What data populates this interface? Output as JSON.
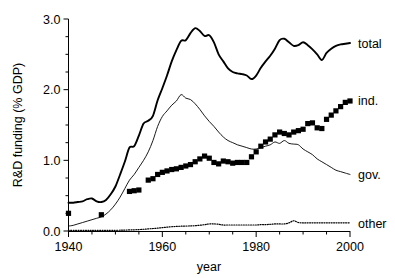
{
  "chart_data": {
    "type": "line",
    "title": "",
    "xlabel": "year",
    "ylabel": "R&D funding (% GDP)",
    "xlim": [
      1940,
      2000
    ],
    "ylim": [
      0.0,
      3.0
    ],
    "x_ticks": [
      1940,
      1960,
      1980,
      2000
    ],
    "x_tick_labels": [
      "1940",
      "1960",
      "1980",
      "2000"
    ],
    "x_minor_step": 5,
    "y_ticks": [
      0.0,
      1.0,
      2.0,
      3.0
    ],
    "y_tick_labels": [
      "0.0",
      "1.0",
      "2.0",
      "3.0"
    ],
    "y_minor_step": 0.25,
    "grid": false,
    "legend_position": "right-inline",
    "series": [
      {
        "name": "total",
        "label": "total",
        "style": "solid-thick",
        "color": "#000000",
        "label_value_x": 2000,
        "label_value_y": 2.66,
        "x": [
          1940,
          1941,
          1942,
          1943,
          1944,
          1945,
          1946,
          1947,
          1948,
          1949,
          1950,
          1951,
          1952,
          1953,
          1954,
          1955,
          1956,
          1957,
          1958,
          1959,
          1960,
          1961,
          1962,
          1963,
          1964,
          1965,
          1966,
          1967,
          1968,
          1969,
          1970,
          1971,
          1972,
          1973,
          1974,
          1975,
          1976,
          1977,
          1978,
          1979,
          1980,
          1981,
          1982,
          1983,
          1984,
          1985,
          1986,
          1987,
          1988,
          1989,
          1990,
          1991,
          1992,
          1993,
          1994,
          1995,
          1996,
          1997,
          1998,
          1999,
          2000
        ],
        "y": [
          0.4,
          0.4,
          0.41,
          0.42,
          0.45,
          0.46,
          0.42,
          0.41,
          0.44,
          0.52,
          0.63,
          0.8,
          0.98,
          1.18,
          1.2,
          1.35,
          1.52,
          1.56,
          1.63,
          1.85,
          2.02,
          2.2,
          2.4,
          2.56,
          2.69,
          2.7,
          2.8,
          2.87,
          2.83,
          2.76,
          2.77,
          2.67,
          2.5,
          2.4,
          2.3,
          2.25,
          2.23,
          2.22,
          2.2,
          2.15,
          2.2,
          2.31,
          2.4,
          2.48,
          2.58,
          2.7,
          2.72,
          2.67,
          2.62,
          2.63,
          2.67,
          2.63,
          2.57,
          2.5,
          2.42,
          2.52,
          2.58,
          2.62,
          2.64,
          2.65,
          2.66
        ]
      },
      {
        "name": "gov",
        "label": "gov.",
        "style": "solid-thin",
        "color": "#000000",
        "label_value_x": 2000,
        "label_value_y": 0.8,
        "x": [
          1940,
          1941,
          1942,
          1943,
          1944,
          1945,
          1946,
          1947,
          1948,
          1949,
          1950,
          1951,
          1952,
          1953,
          1954,
          1955,
          1956,
          1957,
          1958,
          1959,
          1960,
          1961,
          1962,
          1963,
          1964,
          1965,
          1966,
          1967,
          1968,
          1969,
          1970,
          1971,
          1972,
          1973,
          1974,
          1975,
          1976,
          1977,
          1978,
          1979,
          1980,
          1981,
          1982,
          1983,
          1984,
          1985,
          1986,
          1987,
          1988,
          1989,
          1990,
          1991,
          1992,
          1993,
          1994,
          1995,
          1996,
          1997,
          1998,
          1999,
          2000
        ],
        "y": [
          0.07,
          0.08,
          0.1,
          0.12,
          0.14,
          0.16,
          0.18,
          0.2,
          0.24,
          0.3,
          0.38,
          0.48,
          0.6,
          0.72,
          0.8,
          0.9,
          1.0,
          1.12,
          1.28,
          1.48,
          1.62,
          1.7,
          1.78,
          1.84,
          1.93,
          1.88,
          1.86,
          1.8,
          1.72,
          1.63,
          1.55,
          1.48,
          1.4,
          1.33,
          1.28,
          1.25,
          1.22,
          1.2,
          1.18,
          1.16,
          1.16,
          1.18,
          1.2,
          1.22,
          1.26,
          1.24,
          1.28,
          1.24,
          1.23,
          1.22,
          1.16,
          1.12,
          1.08,
          1.02,
          0.98,
          0.94,
          0.9,
          0.86,
          0.84,
          0.82,
          0.8
        ]
      },
      {
        "name": "ind",
        "label": "ind.",
        "style": "square-markers",
        "color": "#000000",
        "label_value_x": 2000,
        "label_value_y": 1.84,
        "x": [
          1940,
          1947,
          1953,
          1954,
          1955,
          1957,
          1958,
          1959,
          1960,
          1961,
          1962,
          1963,
          1964,
          1965,
          1966,
          1967,
          1968,
          1969,
          1970,
          1971,
          1972,
          1973,
          1974,
          1975,
          1976,
          1977,
          1978,
          1979,
          1980,
          1981,
          1982,
          1983,
          1984,
          1985,
          1986,
          1987,
          1988,
          1989,
          1990,
          1991,
          1992,
          1993,
          1994,
          1995,
          1996,
          1997,
          1998,
          1999,
          2000
        ],
        "y": [
          0.25,
          0.23,
          0.56,
          0.57,
          0.58,
          0.72,
          0.74,
          0.8,
          0.83,
          0.85,
          0.87,
          0.88,
          0.9,
          0.92,
          0.94,
          0.98,
          1.02,
          1.06,
          1.03,
          0.97,
          0.95,
          0.99,
          0.98,
          0.96,
          0.97,
          0.97,
          0.97,
          1.05,
          1.12,
          1.2,
          1.26,
          1.3,
          1.36,
          1.4,
          1.38,
          1.36,
          1.4,
          1.42,
          1.44,
          1.52,
          1.53,
          1.46,
          1.45,
          1.58,
          1.64,
          1.7,
          1.76,
          1.82,
          1.84
        ]
      },
      {
        "name": "other",
        "label": "other",
        "style": "dotted",
        "color": "#000000",
        "label_value_x": 2000,
        "label_value_y": 0.11,
        "x": [
          1940,
          1945,
          1950,
          1953,
          1955,
          1957,
          1959,
          1961,
          1963,
          1965,
          1967,
          1969,
          1970,
          1971,
          1972,
          1973,
          1974,
          1975,
          1976,
          1977,
          1978,
          1979,
          1980,
          1981,
          1982,
          1983,
          1984,
          1985,
          1986,
          1987,
          1988,
          1989,
          1990,
          1991,
          1992,
          1993,
          1994,
          1995,
          1996,
          1997,
          1998,
          1999,
          2000
        ],
        "y": [
          0.01,
          0.01,
          0.01,
          0.015,
          0.02,
          0.03,
          0.04,
          0.055,
          0.065,
          0.07,
          0.075,
          0.09,
          0.1,
          0.1,
          0.095,
          0.085,
          0.085,
          0.085,
          0.085,
          0.085,
          0.085,
          0.085,
          0.085,
          0.09,
          0.09,
          0.095,
          0.1,
          0.1,
          0.1,
          0.115,
          0.145,
          0.12,
          0.115,
          0.115,
          0.115,
          0.115,
          0.115,
          0.115,
          0.115,
          0.115,
          0.115,
          0.115,
          0.115
        ]
      }
    ]
  },
  "axes": {
    "x_title": "year",
    "y_title": "R&D funding (% GDP)"
  }
}
